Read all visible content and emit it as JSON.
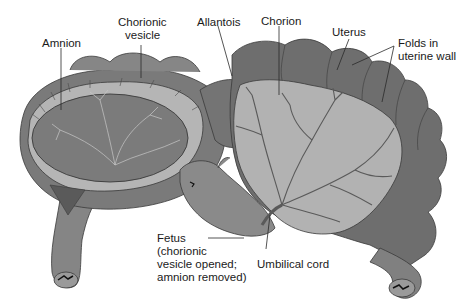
{
  "figure": {
    "colors": {
      "background": "#ffffff",
      "uterus_dark": "#6e6e6e",
      "uterus_mid": "#858585",
      "chorion_light": "#b7b7b7",
      "amnion_dark": "#7a7a7a",
      "vessel": "#5a5a5a",
      "leader_line": "#2a2a2a",
      "text": "#1a1a1a"
    }
  },
  "labels": {
    "amnion": "Amnion",
    "chorionic_vesicle_1": "Chorionic",
    "chorionic_vesicle_2": "vesicle",
    "allantois": "Allantois",
    "chorion": "Chorion",
    "uterus": "Uterus",
    "folds_1": "Folds in",
    "folds_2": "uterine wall",
    "fetus_1": "Fetus",
    "fetus_2": "(chorionic",
    "fetus_3": "vesicle opened;",
    "fetus_4": "amnion removed)",
    "umbilical_cord": "Umbilical cord"
  }
}
